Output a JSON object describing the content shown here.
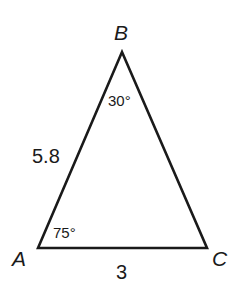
{
  "diagram": {
    "type": "triangle",
    "stroke_color": "#1a1a1a",
    "vertices": [
      {
        "name": "A",
        "label": "A",
        "x": 38,
        "y": 248
      },
      {
        "name": "B",
        "label": "B",
        "x": 122,
        "y": 52
      },
      {
        "name": "C",
        "label": "C",
        "x": 207,
        "y": 248
      }
    ],
    "sides": [
      {
        "from": "A",
        "to": "B",
        "label": "5.8"
      },
      {
        "from": "A",
        "to": "C",
        "label": "3"
      }
    ],
    "angles": [
      {
        "vertex": "A",
        "label": "75°"
      },
      {
        "vertex": "B",
        "label": "30°"
      }
    ]
  }
}
